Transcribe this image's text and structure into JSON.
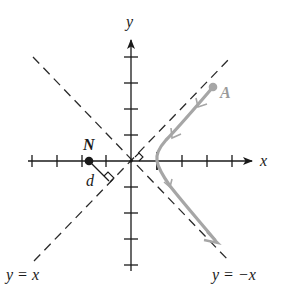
{
  "figure": {
    "axes": {
      "x_label": "x",
      "y_label": "y",
      "tick_spacing_units": 1,
      "x_ticks": [
        -4,
        -3,
        -2,
        -1,
        1,
        2,
        3,
        4
      ],
      "y_ticks": [
        -4,
        -3,
        -2,
        -1,
        1,
        2,
        3,
        4
      ]
    },
    "asymptotes": [
      {
        "label": "y = x",
        "style": "dashed"
      },
      {
        "label": "y = −x",
        "style": "dashed"
      }
    ],
    "points": {
      "N": {
        "label": "N",
        "x": -1.6,
        "y": 0
      },
      "A": {
        "label": "A",
        "x": 3.1,
        "y": 2.9
      }
    },
    "distance_label": "d",
    "curve": {
      "description": "right branch of hyperbola x² − y² = 1 traced from A downward",
      "color": "#a6a6a6",
      "vertex_x": 1
    },
    "colors": {
      "axis": "#1a1a1a",
      "dashed": "#2a2a2a",
      "curve": "#a6a6a6",
      "point_N": "#1a1a1a",
      "point_A": "#a6a6a6"
    }
  }
}
